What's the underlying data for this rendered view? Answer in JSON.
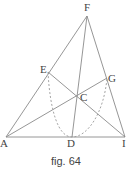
{
  "figure": {
    "caption": "fig. 64",
    "line_color": "#8a8a8a",
    "dash_color": "#9a9a9a",
    "points": {
      "F": {
        "label": "F",
        "x": 87,
        "y": 16
      },
      "A": {
        "label": "A",
        "x": 6,
        "y": 137
      },
      "I": {
        "label": "I",
        "x": 125,
        "y": 137
      },
      "D": {
        "label": "D",
        "x": 72,
        "y": 137
      },
      "E": {
        "label": "E",
        "x": 48,
        "y": 72
      },
      "G": {
        "label": "G",
        "x": 107,
        "y": 78
      },
      "C": {
        "label": "C",
        "x": 77,
        "y": 96
      }
    }
  }
}
